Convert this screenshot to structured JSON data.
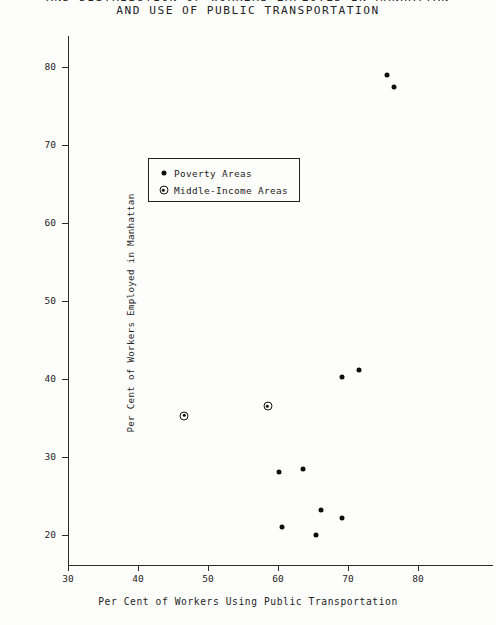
{
  "title": {
    "line1": "AND DISTRIBUTION OF WORKERS EMPLOYED IN MANHATTAN",
    "line2": "AND USE OF PUBLIC TRANSPORTATION"
  },
  "legend": {
    "entries": [
      {
        "label": "Poverty Areas",
        "marker": "filled-dot-icon"
      },
      {
        "label": "Middle-Income Areas",
        "marker": "circled-dot-icon"
      }
    ]
  },
  "chart_data": {
    "type": "scatter",
    "title": "AND USE OF PUBLIC TRANSPORTATION",
    "xlabel": "Per Cent of Workers Using Public Transportation",
    "ylabel": "Per Cent of Workers Employed in Manhattan",
    "xlim": [
      30,
      85
    ],
    "ylim": [
      16,
      84
    ],
    "xticks": [
      30,
      40,
      50,
      60,
      70,
      80
    ],
    "yticks": [
      20,
      30,
      40,
      50,
      60,
      70,
      80
    ],
    "xtick_labels": [
      "30",
      "40",
      "50",
      "60",
      "70",
      "80"
    ],
    "ytick_labels": [
      "20",
      "30",
      "40",
      "50",
      "60",
      "70",
      "80"
    ],
    "grid": false,
    "legend_position": "upper-left-inset",
    "series": [
      {
        "name": "Poverty Areas",
        "marker": "filled-dot",
        "color": "#0d0d0d",
        "points": [
          {
            "x": 75.5,
            "y": 79.0
          },
          {
            "x": 76.6,
            "y": 77.5
          },
          {
            "x": 71.6,
            "y": 41.2
          },
          {
            "x": 69.1,
            "y": 40.2
          },
          {
            "x": 63.6,
            "y": 28.5
          },
          {
            "x": 60.1,
            "y": 28.0
          },
          {
            "x": 66.1,
            "y": 23.2
          },
          {
            "x": 69.1,
            "y": 22.2
          },
          {
            "x": 60.6,
            "y": 21.0
          },
          {
            "x": 65.4,
            "y": 20.0
          }
        ]
      },
      {
        "name": "Middle-Income Areas",
        "marker": "circled-dot",
        "color": "#0d0d0d",
        "points": [
          {
            "x": 46.6,
            "y": 35.3
          },
          {
            "x": 58.5,
            "y": 36.5
          }
        ]
      }
    ]
  }
}
